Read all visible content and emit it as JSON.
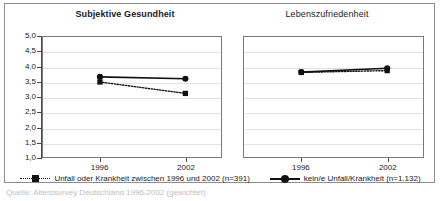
{
  "chart_data": {
    "type": "line",
    "panels": [
      {
        "title": "Subjektive Gesundheit",
        "xlabel": "",
        "ylabel": "",
        "categories": [
          "1996",
          "2002"
        ],
        "ylim": [
          1.0,
          5.0
        ],
        "ytick_labels": [
          "5,0",
          "4,5",
          "4,0",
          "3,5",
          "3,0",
          "2,5",
          "2,0",
          "1,5",
          "1,0"
        ],
        "ytick_values": [
          5.0,
          4.5,
          4.0,
          3.5,
          3.0,
          2.5,
          2.0,
          1.5,
          1.0
        ],
        "grid": true,
        "series": [
          {
            "name": "Unfall oder Krankheit zwischen 1996 und 2002 (n=391)",
            "values": [
              3.5,
              3.12
            ],
            "style": "dotted",
            "marker": "square"
          },
          {
            "name": "kein/e Unfall/Krankheit (n=1.132)",
            "values": [
              3.67,
              3.61
            ],
            "style": "solid",
            "marker": "circle"
          }
        ]
      },
      {
        "title": "Lebenszufriedenheit",
        "xlabel": "",
        "ylabel": "",
        "categories": [
          "1996",
          "2002"
        ],
        "ylim": [
          1.0,
          5.0
        ],
        "ytick_labels": [],
        "ytick_values": [
          5.0,
          4.5,
          4.0,
          3.5,
          3.0,
          2.5,
          2.0,
          1.5,
          1.0
        ],
        "grid": true,
        "series": [
          {
            "name": "Unfall oder Krankheit zwischen 1996 und 2002 (n=391)",
            "values": [
              3.82,
              3.88
            ],
            "style": "dotted",
            "marker": "square"
          },
          {
            "name": "kein/e Unfall/Krankheit (n=1.132)",
            "values": [
              3.83,
              3.96
            ],
            "style": "solid",
            "marker": "circle"
          }
        ]
      }
    ],
    "legend": {
      "position": "bottom",
      "entries": [
        {
          "label": "Unfall oder Krankheit zwischen 1996 und 2002 (n=391)",
          "style": "dotted",
          "marker": "square",
          "color": "#111111"
        },
        {
          "label": "kein/e Unfall/Krankheit (n=1.132)",
          "style": "solid",
          "marker": "circle",
          "color": "#111111"
        }
      ]
    },
    "source_note": "Quelle: Alterssurvey Deutschland 1996-2002 (gewichtet)",
    "colors": {
      "series": "#111111",
      "grid": "#e2e2e2",
      "axis": "#4a4a4a",
      "frame": "#8d8d8d"
    }
  }
}
